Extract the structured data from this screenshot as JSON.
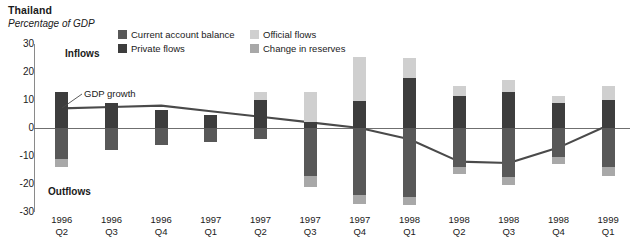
{
  "header": {
    "title": "Thailand",
    "subtitle": "Percentage of GDP"
  },
  "annotations": {
    "inflows": "Inflows",
    "outflows": "Outflows",
    "gdp_growth": "GDP growth"
  },
  "legend": {
    "items": [
      {
        "label": "Current account balance",
        "color": "#585858"
      },
      {
        "label": "Private flows",
        "color": "#3d3d3d"
      },
      {
        "label": "Official flows",
        "color": "#cfcfcf"
      },
      {
        "label": "Change in reserves",
        "color": "#a8a8a8"
      }
    ]
  },
  "chart_data": {
    "type": "bar",
    "title": "Thailand",
    "subtitle": "Percentage of GDP",
    "xlabel": "",
    "ylabel": "Percentage of GDP",
    "ylim": [
      -30,
      30
    ],
    "yticks": [
      30,
      20,
      10,
      0,
      -10,
      -20,
      -30
    ],
    "grid": false,
    "legend_position": "top",
    "stacked": true,
    "categories": [
      "1996 Q2",
      "1996 Q3",
      "1996 Q4",
      "1997 Q1",
      "1997 Q2",
      "1997 Q3",
      "1997 Q4",
      "1998 Q1",
      "1998 Q2",
      "1998 Q3",
      "1998 Q4",
      "1999 Q1"
    ],
    "category_years": [
      "1996",
      "1996",
      "1996",
      "1997",
      "1997",
      "1997",
      "1997",
      "1998",
      "1998",
      "1998",
      "1998",
      "1999"
    ],
    "category_quarters": [
      "Q2",
      "Q3",
      "Q4",
      "Q1",
      "Q2",
      "Q3",
      "Q4",
      "Q1",
      "Q2",
      "Q3",
      "Q4",
      "Q1"
    ],
    "series": [
      {
        "name": "Private flows",
        "color": "#3d3d3d",
        "values": [
          13.0,
          9.0,
          6.5,
          4.5,
          10.0,
          2.0,
          9.5,
          18.0,
          11.5,
          13.0,
          9.0,
          10.0
        ]
      },
      {
        "name": "Official flows",
        "color": "#cfcfcf",
        "values": [
          0.0,
          0.0,
          0.0,
          0.0,
          3.0,
          11.0,
          16.0,
          7.0,
          3.5,
          4.0,
          2.5,
          5.0
        ]
      },
      {
        "name": "Current account balance",
        "color": "#585858",
        "values": [
          -11.0,
          -8.0,
          -6.0,
          -5.0,
          -4.0,
          -17.0,
          -24.0,
          -24.5,
          -14.0,
          -17.5,
          -10.5,
          -14.0
        ]
      },
      {
        "name": "Change in reserves",
        "color": "#a8a8a8",
        "values": [
          -3.0,
          0.0,
          0.0,
          0.0,
          0.0,
          -4.0,
          -3.0,
          -3.0,
          -2.5,
          -3.0,
          -2.5,
          -3.0
        ]
      }
    ],
    "line_series": {
      "name": "GDP growth",
      "color": "#4a4a4a",
      "values": [
        7.0,
        7.5,
        8.0,
        6.0,
        4.0,
        2.0,
        0.0,
        -4.0,
        -12.0,
        -12.5,
        -7.0,
        1.0
      ]
    }
  }
}
